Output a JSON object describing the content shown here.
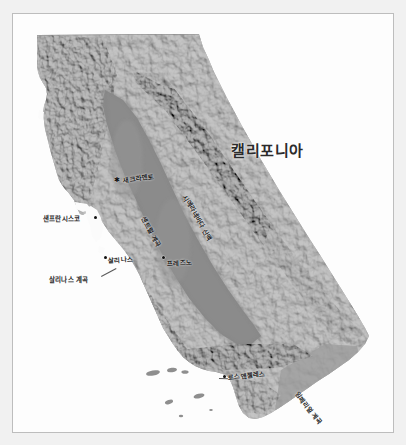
{
  "map": {
    "title": "캘리포니아",
    "subject": "California shaded relief map",
    "title_position": {
      "x": 218,
      "y": 125
    },
    "colors": {
      "page_background": "#f1f1f1",
      "frame_background": "#fdfdfd",
      "frame_border": "#bdbdbd",
      "label_text": "#1c1c1c",
      "title_text": "#2b2b2b",
      "marker": "#111111",
      "terrain_light": "#d6d6d6",
      "terrain_mid": "#9a9a9a",
      "terrain_dark": "#5e5e5e",
      "valley_fill": "#8d8d8d",
      "water": "#fbfbfb"
    },
    "cities": [
      {
        "name": "새크라멘토",
        "marker": "star",
        "marker_x": 104,
        "marker_y": 166,
        "label_x": 110,
        "label_y": 161,
        "rotation": -8
      },
      {
        "name": "샌프란시스코",
        "marker": "dot",
        "marker_x": 82,
        "marker_y": 203,
        "label_x": 32,
        "label_y": 200,
        "rotation": 0
      },
      {
        "name": "살리나스",
        "marker": "dot",
        "marker_x": 92,
        "marker_y": 243,
        "label_x": 96,
        "label_y": 242,
        "rotation": -4
      },
      {
        "name": "프레즈노",
        "marker": "dot",
        "marker_x": 150,
        "marker_y": 243,
        "label_x": 155,
        "label_y": 245,
        "rotation": -3
      },
      {
        "name": "로스앤젤레스",
        "marker": "dot",
        "marker_x": 218,
        "marker_y": 362,
        "label_x": 222,
        "label_y": 359,
        "rotation": -6
      }
    ],
    "regions": [
      {
        "name": "센트럴 계곡",
        "label_x": 131,
        "label_y": 198,
        "rotation": 62
      },
      {
        "name": "시에라네바다 산맥",
        "label_x": 172,
        "label_y": 176,
        "rotation": 60
      },
      {
        "name": "살리나스 계곡",
        "label_x": 38,
        "label_y": 261,
        "rotation": 0
      },
      {
        "name": "임페리얼 계곡",
        "label_x": 284,
        "label_y": 373,
        "rotation": 52
      }
    ],
    "leaders": [
      {
        "x": 88,
        "y": 262,
        "length": 17,
        "angle": -28
      },
      {
        "x": 212,
        "y": 364,
        "length": 9,
        "angle": 2
      }
    ]
  }
}
